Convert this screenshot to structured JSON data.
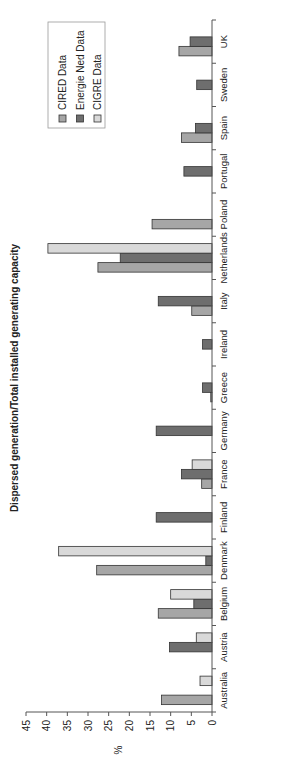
{
  "chart_data": {
    "type": "bar",
    "orientation": "vertical-bars, image rotated 90 degrees counter-clockwise",
    "title": "Dispersed generation/Total installed generating capacity",
    "xlabel": "",
    "ylabel": "%",
    "ylim": [
      0,
      45
    ],
    "yticks": [
      0,
      5,
      10,
      15,
      20,
      25,
      30,
      35,
      40,
      45
    ],
    "grid": false,
    "legend_position": "upper right",
    "categories": [
      "Australia",
      "Austria",
      "Belgium",
      "Denmark",
      "Finland",
      "France",
      "Germany",
      "Greece",
      "Ireland",
      "Italy",
      "Netherlands",
      "Poland",
      "Portugal",
      "Spain",
      "Sweden",
      "UK"
    ],
    "series": [
      {
        "name": "CIRED Data",
        "color": "#a6a6a6",
        "values": [
          12.2,
          null,
          13.0,
          27.9,
          null,
          2.5,
          null,
          0.3,
          null,
          4.9,
          27.6,
          14.5,
          null,
          7.4,
          null,
          8.0
        ]
      },
      {
        "name": "Energie Ned Data",
        "color": "#6e6e6e",
        "values": [
          null,
          10.3,
          4.4,
          1.5,
          13.5,
          7.4,
          13.5,
          2.3,
          2.3,
          13.0,
          22.2,
          null,
          6.8,
          4.0,
          3.7,
          5.3
        ]
      },
      {
        "name": "CIGRE Data",
        "color": "#d9d9d9",
        "values": [
          2.9,
          3.8,
          10.0,
          37.1,
          null,
          4.8,
          null,
          null,
          null,
          null,
          39.7,
          null,
          null,
          null,
          null,
          null
        ]
      }
    ]
  }
}
